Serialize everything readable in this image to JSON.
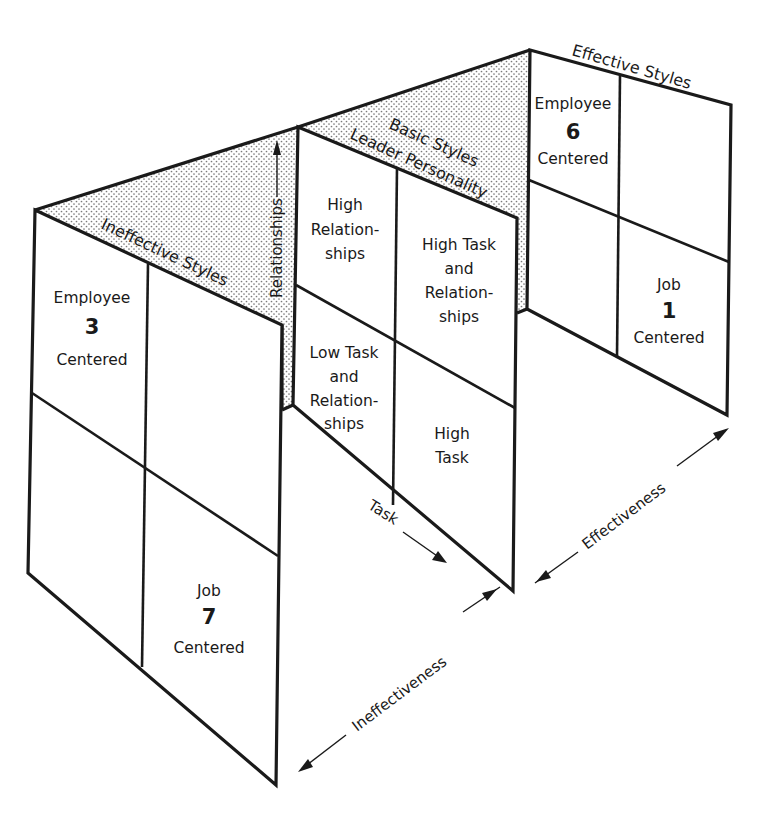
{
  "diagram": {
    "panels": {
      "ineffective": {
        "title": "Ineffective Styles",
        "cells": {
          "top_left": {
            "line1": "Employee",
            "number": "3",
            "line2": "Centered"
          },
          "top_right": {},
          "bottom_left": {},
          "bottom_right": {
            "line1": "Job",
            "number": "7",
            "line2": "Centered"
          }
        }
      },
      "basic": {
        "title_line1": "Basic Styles",
        "title_line2": "Leader Personality",
        "cells": {
          "top_left": {
            "lines": [
              "High",
              "Relation-",
              "ships"
            ]
          },
          "top_right": {
            "lines": [
              "High Task",
              "and",
              "Relation-",
              "ships"
            ]
          },
          "bottom_left": {
            "lines": [
              "Low Task",
              "and",
              "Relation-",
              "ships"
            ]
          },
          "bottom_right": {
            "lines": [
              "High",
              "Task"
            ]
          }
        }
      },
      "effective": {
        "title": "Effective Styles",
        "cells": {
          "top_left": {
            "line1": "Employee",
            "number": "6",
            "line2": "Centered"
          },
          "top_right": {},
          "bottom_left": {},
          "bottom_right": {
            "line1": "Job",
            "number": "1",
            "line2": "Centered"
          }
        }
      }
    },
    "axes": {
      "relationships": "Relationships",
      "task": "Task",
      "effectiveness": "Effectiveness",
      "ineffectiveness": "Ineffectiveness"
    },
    "colors": {
      "ink": "#1a1a1a",
      "paper": "#ffffff",
      "stipple": "#8a8a8a"
    }
  }
}
